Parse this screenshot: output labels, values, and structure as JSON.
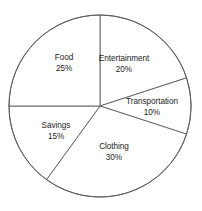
{
  "chart_data": {
    "type": "pie",
    "title": "",
    "subtitle": "",
    "xlabel": "",
    "ylabel": "",
    "legend_position": "none",
    "grid": false,
    "labels_inside": true,
    "start_angle_deg": 0,
    "direction": "clockwise",
    "categories": [
      "Entertainment",
      "Transportation",
      "Clothing",
      "Savings",
      "Food"
    ],
    "values": [
      20,
      10,
      30,
      15,
      25
    ],
    "value_suffix": "%",
    "total": 100,
    "slices": [
      {
        "name": "Entertainment",
        "value": 20,
        "value_text": "20%",
        "start_deg": 0,
        "end_deg": 72,
        "label_x": 124,
        "label_y": 64,
        "color": "#ffffff",
        "stroke": "#5d5d5d"
      },
      {
        "name": "Transportation",
        "value": 10,
        "value_text": "10%",
        "start_deg": 72,
        "end_deg": 108,
        "label_x": 152,
        "label_y": 107,
        "color": "#ffffff",
        "stroke": "#5d5d5d"
      },
      {
        "name": "Clothing",
        "value": 30,
        "value_text": "30%",
        "start_deg": 108,
        "end_deg": 216,
        "label_x": 114,
        "label_y": 152,
        "color": "#ffffff",
        "stroke": "#5d5d5d"
      },
      {
        "name": "Savings",
        "value": 15,
        "value_text": "15%",
        "start_deg": 216,
        "end_deg": 270,
        "label_x": 56,
        "label_y": 131,
        "color": "#ffffff",
        "stroke": "#5d5d5d"
      },
      {
        "name": "Food",
        "value": 25,
        "value_text": "25%",
        "start_deg": 270,
        "end_deg": 360,
        "label_x": 64,
        "label_y": 63,
        "color": "#ffffff",
        "stroke": "#5d5d5d"
      }
    ],
    "geometry": {
      "center_x": 100,
      "center_y": 106,
      "radius": 91
    },
    "colors": {
      "background": "#ffffff",
      "stroke": "#5d5d5d",
      "text": "#1d1d1d"
    }
  }
}
